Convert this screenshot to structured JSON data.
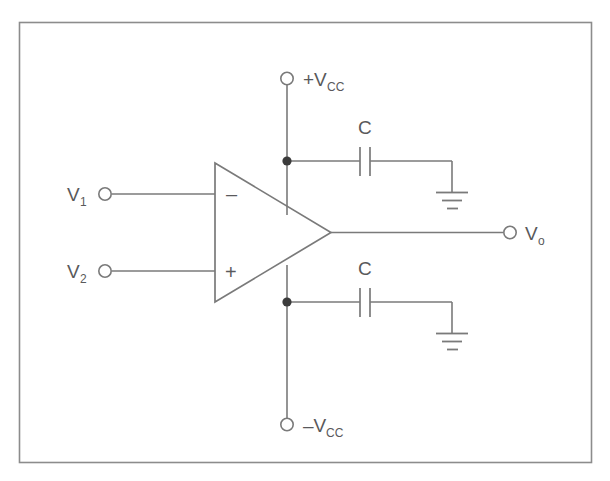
{
  "figure": {
    "background_color": "#ffffff",
    "line_color": "#7a7a7a",
    "text_color": "#59595b",
    "junction_color": "#3b3b3b",
    "border_color": "#8c8c8c"
  },
  "labels": {
    "supply_positive": {
      "text": "+V",
      "subscript": "CC"
    },
    "supply_negative": {
      "text": "–V",
      "subscript": "CC"
    },
    "input_one": {
      "text": "V",
      "subscript": "1"
    },
    "input_two": {
      "text": "V",
      "subscript": "2"
    },
    "output": {
      "text": "V",
      "subscript": "o"
    },
    "capacitor_top": {
      "text": "C"
    },
    "capacitor_bottom": {
      "text": "C"
    },
    "inverting_sign": {
      "text": "–"
    },
    "noninverting_sign": {
      "text": "+"
    }
  },
  "components": {
    "opamp": {
      "name": "operational-amplifier",
      "shape": "triangle",
      "inverting_input": "V1",
      "noninverting_input": "V2",
      "output": "Vo"
    },
    "capacitors": [
      {
        "name": "decoupling-capacitor-top",
        "label": "C",
        "connects": [
          "+Vcc rail",
          "ground"
        ]
      },
      {
        "name": "decoupling-capacitor-bottom",
        "label": "C",
        "connects": [
          "-Vcc rail",
          "ground"
        ]
      }
    ],
    "grounds": [
      {
        "name": "ground-top",
        "bars": 3
      },
      {
        "name": "ground-bottom",
        "bars": 3
      }
    ],
    "terminals": [
      {
        "name": "terminal-vcc-positive",
        "label": "+Vcc"
      },
      {
        "name": "terminal-vcc-negative",
        "label": "-Vcc"
      },
      {
        "name": "terminal-v1",
        "label": "V1"
      },
      {
        "name": "terminal-v2",
        "label": "V2"
      },
      {
        "name": "terminal-vo",
        "label": "Vo"
      }
    ],
    "junctions": [
      {
        "name": "junction-positive-rail"
      },
      {
        "name": "junction-negative-rail"
      }
    ]
  }
}
